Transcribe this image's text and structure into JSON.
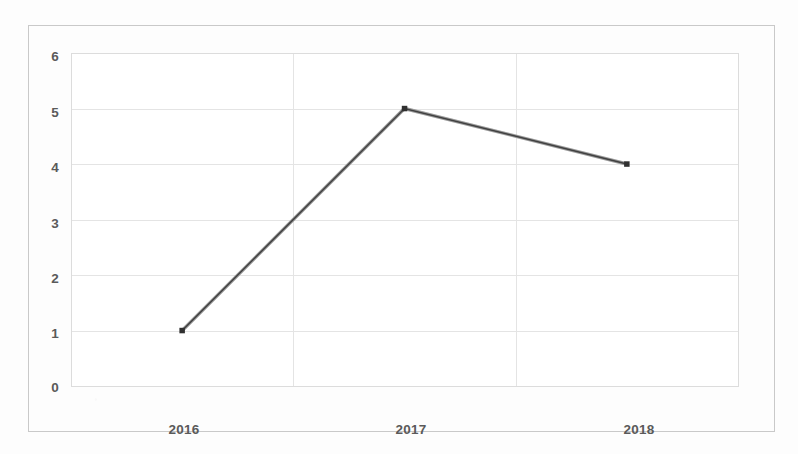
{
  "chart_data": {
    "type": "line",
    "title": "",
    "subtitle": "",
    "xlabel": "",
    "ylabel": "",
    "categories": [
      "2016",
      "2017",
      "2018"
    ],
    "series": [
      {
        "name": "",
        "values": [
          1,
          5,
          4
        ],
        "color": "#404040",
        "marker": "square"
      }
    ],
    "yticks": [
      "0",
      "1",
      "2",
      "3",
      "4",
      "5",
      "6"
    ],
    "ylim": [
      0,
      6
    ],
    "grid": true,
    "grid_axis": "both",
    "legend": "none",
    "plot_border": true,
    "outer_border": true
  },
  "axes": {
    "y_tick_labels": [
      "6",
      "5",
      "4",
      "3",
      "2",
      "1",
      "0"
    ],
    "x_tick_labels": [
      "2016",
      "2017",
      "2018"
    ]
  },
  "colors": {
    "line": "#404040",
    "marker": "#303030",
    "grid": "#e2e2e2",
    "plot_border": "#d4d4d4",
    "outer_border": "#c9c9c9",
    "tick_text": "#5a5a5a",
    "background": "#fdfdfd"
  }
}
